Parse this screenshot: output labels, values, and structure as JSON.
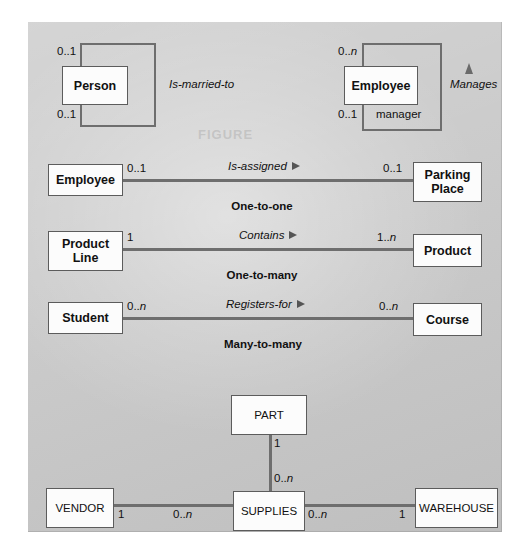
{
  "figure": {
    "background_color": "#c9c9c9",
    "box_fill": "#fcfcfc",
    "line_color": "#6e6e6e"
  },
  "recursive_relationships": [
    {
      "entity": "Person",
      "relationship_label": "Is-married-to",
      "cardinality_top": "0..1",
      "cardinality_bottom": "0..1",
      "role_label": ""
    },
    {
      "entity": "Employee",
      "relationship_label": "Manages",
      "cardinality_top": "0..n",
      "cardinality_bottom": "0..1",
      "role_label": "manager"
    }
  ],
  "binary_relationships": [
    {
      "left_entity": "Employee",
      "right_entity": "Parking Place",
      "left_entity_line1": "Employee",
      "left_entity_line2": "",
      "right_entity_line1": "Parking",
      "right_entity_line2": "Place",
      "left_cardinality": "0..1",
      "right_cardinality": "0..1",
      "relationship_label": "Is-assigned",
      "caption": "One-to-one"
    },
    {
      "left_entity": "Product Line",
      "right_entity": "Product",
      "left_entity_line1": "Product",
      "left_entity_line2": "Line",
      "right_entity_line1": "Product",
      "right_entity_line2": "",
      "left_cardinality": "1",
      "right_cardinality": "1..n",
      "relationship_label": "Contains",
      "caption": "One-to-many"
    },
    {
      "left_entity": "Student",
      "right_entity": "Course",
      "left_entity_line1": "Student",
      "left_entity_line2": "",
      "right_entity_line1": "Course",
      "right_entity_line2": "",
      "left_cardinality": "0..n",
      "right_cardinality": "0..n",
      "relationship_label": "Registers-for",
      "caption": "Many-to-many"
    }
  ],
  "ternary_relationship": {
    "top_entity": "PART",
    "center_entity": "SUPPLIES",
    "left_entity": "VENDOR",
    "right_entity": "WAREHOUSE",
    "part_side_cardinality": "1",
    "supplies_top_cardinality": "0..n",
    "vendor_side_cardinality": "1",
    "supplies_left_cardinality": "0..n",
    "supplies_right_cardinality": "0..n",
    "warehouse_side_cardinality": "1"
  }
}
